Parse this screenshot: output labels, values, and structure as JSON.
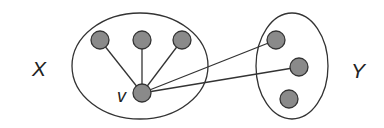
{
  "diagram": {
    "type": "bipartite-neighborhood",
    "colors": {
      "stroke": "#333333",
      "node_fill": "#8a8a8a",
      "node_stroke": "#333333",
      "label": "#222222"
    },
    "sets": [
      {
        "id": "X",
        "label": "X",
        "ellipse": {
          "cx": 140,
          "cy": 66,
          "rx": 68,
          "ry": 53
        },
        "label_pos": {
          "x": 32,
          "y": 76
        }
      },
      {
        "id": "Y",
        "label": "Y",
        "ellipse": {
          "cx": 292,
          "cy": 66,
          "rx": 36,
          "ry": 53
        },
        "label_pos": {
          "x": 351,
          "y": 78
        }
      }
    ],
    "nodes": [
      {
        "id": "x1",
        "set": "X",
        "x": 100,
        "y": 40
      },
      {
        "id": "x2",
        "set": "X",
        "x": 142,
        "y": 40
      },
      {
        "id": "x3",
        "set": "X",
        "x": 182,
        "y": 40
      },
      {
        "id": "v",
        "set": "X",
        "x": 142,
        "y": 93,
        "label": "v",
        "label_pos": {
          "x": 117,
          "y": 102
        }
      },
      {
        "id": "y1",
        "set": "Y",
        "x": 276,
        "y": 40
      },
      {
        "id": "y2",
        "set": "Y",
        "x": 299,
        "y": 67
      },
      {
        "id": "y3",
        "set": "Y",
        "x": 289,
        "y": 99
      }
    ],
    "edges": [
      {
        "from": "v",
        "to": "x1"
      },
      {
        "from": "v",
        "to": "x2"
      },
      {
        "from": "v",
        "to": "x3"
      },
      {
        "from": "v",
        "to": "y1"
      },
      {
        "from": "v",
        "to": "y2"
      }
    ],
    "node_radius": 9
  }
}
